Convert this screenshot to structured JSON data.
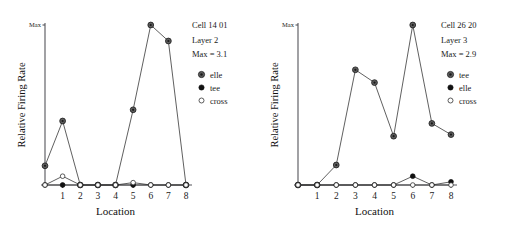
{
  "figure": {
    "width": 509,
    "height": 232,
    "background": "#ffffff",
    "ink_color": "#1a1a1a"
  },
  "panels": [
    {
      "id": "left",
      "annotation": {
        "cell": "Cell 14 01",
        "layer": "Layer 2",
        "max": "Max = 3.1"
      },
      "legend": [
        {
          "label": "elle",
          "marker": "circle-dot-icon"
        },
        {
          "label": "tee",
          "marker": "filled-circle-icon"
        },
        {
          "label": "cross",
          "marker": "open-circle-icon"
        }
      ],
      "chart_data": {
        "type": "line",
        "title": "Cell 14 01 Layer 2 Max = 3.1",
        "xlabel": "Location",
        "ylabel": "Relative Firing Rate",
        "x": [
          0,
          1,
          2,
          3,
          4,
          5,
          6,
          7,
          8
        ],
        "xtick_labels": [
          "1",
          "2",
          "3",
          "4",
          "5",
          "6",
          "7",
          "8"
        ],
        "xtick_values": [
          1,
          2,
          3,
          4,
          5,
          6,
          7,
          8
        ],
        "xlim": [
          0,
          8
        ],
        "ylim": [
          0,
          1
        ],
        "ytick_labels": [
          "Max"
        ],
        "ytick_values": [
          1
        ],
        "y_max_value": 3.1,
        "grid": false,
        "legend_position": "outside-right",
        "series": [
          {
            "name": "elle",
            "marker": "circle-dot",
            "values": [
              0.12,
              0.4,
              0.0,
              0.0,
              0.0,
              0.47,
              1.0,
              0.9,
              0.0
            ]
          },
          {
            "name": "tee",
            "marker": "filled-circle",
            "values": [
              0.0,
              0.0,
              0.0,
              0.0,
              0.0,
              0.0,
              0.0,
              0.0,
              0.0
            ]
          },
          {
            "name": "cross",
            "marker": "open-circle",
            "values": [
              0.0,
              0.055,
              0.0,
              0.0,
              0.0,
              0.015,
              0.0,
              0.0,
              0.0
            ]
          }
        ]
      }
    },
    {
      "id": "right",
      "annotation": {
        "cell": "Cell 26 20",
        "layer": "Layer 3",
        "max": "Max = 2.9"
      },
      "legend": [
        {
          "label": "tee",
          "marker": "circle-dot-icon"
        },
        {
          "label": "elle",
          "marker": "filled-circle-icon"
        },
        {
          "label": "cross",
          "marker": "open-circle-icon"
        }
      ],
      "chart_data": {
        "type": "line",
        "title": "Cell 26 20 Layer 3 Max = 2.9",
        "xlabel": "Location",
        "ylabel": "Relative Firing Rate",
        "x": [
          0,
          1,
          2,
          3,
          4,
          5,
          6,
          7,
          8
        ],
        "xtick_labels": [
          "1",
          "2",
          "3",
          "4",
          "5",
          "6",
          "7",
          "8"
        ],
        "xtick_values": [
          1,
          2,
          3,
          4,
          5,
          6,
          7,
          8
        ],
        "xlim": [
          0,
          8
        ],
        "ylim": [
          0,
          1
        ],
        "ytick_labels": [
          "Max"
        ],
        "ytick_values": [
          1
        ],
        "y_max_value": 2.9,
        "grid": false,
        "legend_position": "outside-right",
        "series": [
          {
            "name": "tee",
            "marker": "circle-dot",
            "values": [
              0.0,
              0.0,
              0.125,
              0.72,
              0.64,
              0.305,
              1.0,
              0.385,
              0.315
            ]
          },
          {
            "name": "elle",
            "marker": "filled-circle",
            "values": [
              0.0,
              0.0,
              0.0,
              0.0,
              0.0,
              0.0,
              0.055,
              0.0,
              0.02
            ]
          },
          {
            "name": "cross",
            "marker": "open-circle",
            "values": [
              0.0,
              0.0,
              0.0,
              0.0,
              0.0,
              0.0,
              0.0,
              0.0,
              0.0
            ]
          }
        ]
      }
    }
  ]
}
